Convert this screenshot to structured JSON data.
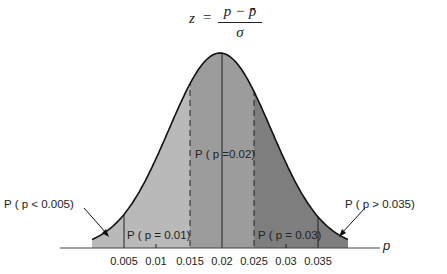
{
  "formula": {
    "lhs": "z",
    "equals": "=",
    "numerator": "p − p̄",
    "denominator": "σ"
  },
  "axis": {
    "label": "p",
    "ticks": [
      "0.005",
      "0.01",
      "0.015",
      "0.02",
      "0.025",
      "0.03",
      "0.035"
    ]
  },
  "annotations": {
    "left_tail": "P ( p < 0.005)",
    "right_tail": "P ( p > 0.035)",
    "center": "P ( p =0.02)",
    "left_band": "P ( p = 0.01)",
    "right_band": "P ( p = 0.03)"
  },
  "colors": {
    "outer_left": "#b9b9b9",
    "middle": "#9c9c9c",
    "outer_right": "#7e7e7e",
    "curve": "#111111"
  },
  "chart_data": {
    "type": "area",
    "xlabel": "p",
    "ylabel": "",
    "distribution": "normal",
    "mean": 0.02,
    "sigma_approx": 0.008,
    "xlim": [
      0.0,
      0.04
    ],
    "x_ticks": [
      0.005,
      0.01,
      0.015,
      0.02,
      0.025,
      0.03,
      0.035
    ],
    "regions": [
      {
        "name": "P(p < 0.005)",
        "from": 0.0,
        "to": 0.005,
        "shade": "light"
      },
      {
        "name": "P(p = 0.01)",
        "from": 0.005,
        "to": 0.015,
        "shade": "light"
      },
      {
        "name": "P(p = 0.02)",
        "from": 0.015,
        "to": 0.025,
        "shade": "medium"
      },
      {
        "name": "P(p = 0.03)",
        "from": 0.025,
        "to": 0.035,
        "shade": "dark"
      },
      {
        "name": "P(p > 0.035)",
        "from": 0.035,
        "to": 0.04,
        "shade": "dark"
      }
    ],
    "vertical_lines": [
      {
        "x": 0.005,
        "style": "solid"
      },
      {
        "x": 0.015,
        "style": "dashed"
      },
      {
        "x": 0.02,
        "style": "solid"
      },
      {
        "x": 0.025,
        "style": "dashed"
      },
      {
        "x": 0.035,
        "style": "solid"
      }
    ],
    "grid": false,
    "legend": "none"
  }
}
